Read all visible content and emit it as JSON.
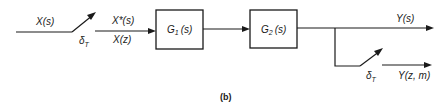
{
  "diagram": {
    "input_label": "X(s)",
    "sampler1_label": "δ",
    "sampler1_sub": "T",
    "sampled_label_top": "X*(s)",
    "sampled_label_bottom": "X(z)",
    "block1": {
      "name": "G",
      "sub": "1",
      "arg": "(s)"
    },
    "block2": {
      "name": "G",
      "sub": "2",
      "arg": "(s)"
    },
    "output_label": "Y(s)",
    "sampler2_label": "δ",
    "sampler2_sub": "T",
    "sampled_output_label": "Y(z, m)",
    "caption": "(b)"
  }
}
